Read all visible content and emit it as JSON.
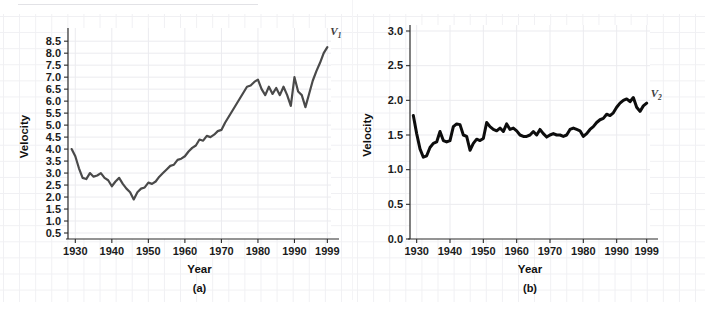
{
  "figure": {
    "background_color": "#ffffff",
    "panels": [
      {
        "id": "a",
        "caption": "(a)",
        "series_label": "V",
        "series_subscript": "1",
        "line_color": "#4a4a4a",
        "line_width": 2.2
      },
      {
        "id": "b",
        "caption": "(b)",
        "series_label": "V",
        "series_subscript": "2",
        "line_color": "#0d0d0d",
        "line_width": 3.0
      }
    ]
  },
  "chart_data": [
    {
      "type": "line",
      "id": "panel-a",
      "title": "(a)",
      "xlabel": "Year",
      "ylabel": "Velocity",
      "grid": true,
      "legend_position": "inline-end-of-line",
      "legend": [
        "V1"
      ],
      "xlim": [
        1928,
        2000
      ],
      "ylim": [
        0.25,
        8.8
      ],
      "xticks": [
        1930,
        1940,
        1950,
        1960,
        1970,
        1980,
        1990,
        1999
      ],
      "xticklabels": [
        "1930",
        "1940",
        "1950",
        "1960",
        "1970",
        "1980",
        "1990",
        "1999"
      ],
      "yticks": [
        0.5,
        1.0,
        1.5,
        2.0,
        2.5,
        3.0,
        3.5,
        4.0,
        4.5,
        5.0,
        5.5,
        6.0,
        6.5,
        7.0,
        7.5,
        8.0,
        8.5
      ],
      "yticklabels": [
        "0.5",
        "1.0",
        "1.5",
        "2.0",
        "2.5",
        "3.0",
        "3.5",
        "4.0",
        "4.5",
        "5.0",
        "5.5",
        "6.0",
        "6.5",
        "7.0",
        "7.5",
        "8.0",
        "8.5"
      ],
      "series": [
        {
          "name": "V1",
          "color": "#4a4a4a",
          "x": [
            1929,
            1930,
            1931,
            1932,
            1933,
            1934,
            1935,
            1936,
            1937,
            1938,
            1939,
            1940,
            1941,
            1942,
            1943,
            1944,
            1945,
            1946,
            1947,
            1948,
            1949,
            1950,
            1951,
            1952,
            1953,
            1954,
            1955,
            1956,
            1957,
            1958,
            1959,
            1960,
            1961,
            1962,
            1963,
            1964,
            1965,
            1966,
            1967,
            1968,
            1969,
            1970,
            1971,
            1972,
            1973,
            1974,
            1975,
            1976,
            1977,
            1978,
            1979,
            1980,
            1981,
            1982,
            1983,
            1984,
            1985,
            1986,
            1987,
            1988,
            1989,
            1990,
            1991,
            1992,
            1993,
            1994,
            1995,
            1996,
            1997,
            1998,
            1999
          ],
          "values": [
            4.0,
            3.7,
            3.2,
            2.8,
            2.75,
            3.0,
            2.85,
            2.9,
            3.0,
            2.8,
            2.7,
            2.45,
            2.65,
            2.8,
            2.55,
            2.35,
            2.2,
            1.9,
            2.2,
            2.35,
            2.4,
            2.6,
            2.55,
            2.65,
            2.85,
            3.0,
            3.15,
            3.3,
            3.35,
            3.55,
            3.6,
            3.7,
            3.9,
            4.05,
            4.15,
            4.4,
            4.35,
            4.55,
            4.5,
            4.6,
            4.75,
            4.8,
            5.1,
            5.35,
            5.6,
            5.85,
            6.1,
            6.35,
            6.6,
            6.65,
            6.8,
            6.9,
            6.5,
            6.25,
            6.6,
            6.3,
            6.55,
            6.25,
            6.6,
            6.25,
            5.8,
            7.0,
            6.4,
            6.25,
            5.75,
            6.3,
            6.85,
            7.25,
            7.6,
            8.0,
            8.25
          ]
        }
      ]
    },
    {
      "type": "line",
      "id": "panel-b",
      "title": "(b)",
      "xlabel": "Year",
      "ylabel": "Velocity",
      "grid": true,
      "legend_position": "inline-end-of-line",
      "legend": [
        "V2"
      ],
      "xlim": [
        1928,
        2000
      ],
      "ylim": [
        0.0,
        3.0
      ],
      "xticks": [
        1930,
        1940,
        1950,
        1960,
        1970,
        1980,
        1990,
        1999
      ],
      "xticklabels": [
        "1930",
        "1940",
        "1950",
        "1960",
        "1970",
        "1980",
        "1990",
        "1999"
      ],
      "yticks": [
        0.0,
        0.5,
        1.0,
        1.5,
        2.0,
        2.5,
        3.0
      ],
      "yticklabels": [
        "0.0",
        "0.5",
        "1.0",
        "1.5",
        "2.0",
        "2.5",
        "3.0"
      ],
      "series": [
        {
          "name": "V2",
          "color": "#0d0d0d",
          "x": [
            1929,
            1930,
            1931,
            1932,
            1933,
            1934,
            1935,
            1936,
            1937,
            1938,
            1939,
            1940,
            1941,
            1942,
            1943,
            1944,
            1945,
            1946,
            1947,
            1948,
            1949,
            1950,
            1951,
            1952,
            1953,
            1954,
            1955,
            1956,
            1957,
            1958,
            1959,
            1960,
            1961,
            1962,
            1963,
            1964,
            1965,
            1966,
            1967,
            1968,
            1969,
            1970,
            1971,
            1972,
            1973,
            1974,
            1975,
            1976,
            1977,
            1978,
            1979,
            1980,
            1981,
            1982,
            1983,
            1984,
            1985,
            1986,
            1987,
            1988,
            1989,
            1990,
            1991,
            1992,
            1993,
            1994,
            1995,
            1996,
            1997,
            1998,
            1999
          ],
          "values": [
            1.78,
            1.52,
            1.3,
            1.18,
            1.2,
            1.32,
            1.38,
            1.4,
            1.55,
            1.42,
            1.4,
            1.42,
            1.62,
            1.66,
            1.65,
            1.5,
            1.48,
            1.28,
            1.38,
            1.44,
            1.42,
            1.45,
            1.68,
            1.62,
            1.58,
            1.56,
            1.6,
            1.55,
            1.66,
            1.58,
            1.6,
            1.56,
            1.5,
            1.48,
            1.48,
            1.5,
            1.55,
            1.5,
            1.58,
            1.52,
            1.47,
            1.5,
            1.52,
            1.5,
            1.5,
            1.48,
            1.5,
            1.58,
            1.6,
            1.58,
            1.56,
            1.48,
            1.52,
            1.58,
            1.62,
            1.68,
            1.72,
            1.74,
            1.8,
            1.78,
            1.82,
            1.9,
            1.96,
            2.0,
            2.02,
            1.98,
            2.04,
            1.9,
            1.84,
            1.92,
            1.96
          ]
        }
      ]
    }
  ]
}
